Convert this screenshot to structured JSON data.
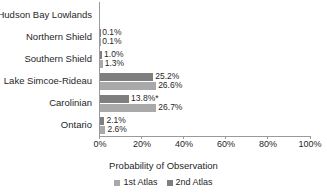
{
  "chart_data": {
    "type": "bar",
    "orientation": "horizontal",
    "title": "",
    "xlabel": "Probability of Observation",
    "ylabel": "",
    "xlim": [
      0,
      100
    ],
    "xunit": "%",
    "grid": false,
    "legend_position": "bottom",
    "xticks": [
      "0%",
      "20%",
      "40%",
      "60%",
      "80%",
      "100%"
    ],
    "xtick_values": [
      0,
      20,
      40,
      60,
      80,
      100
    ],
    "categories": [
      "Hudson Bay Lowlands",
      "Northern Shield",
      "Southern Shield",
      "Lake Simcoe-Rideau",
      "Carolinian",
      "Ontario"
    ],
    "series": [
      {
        "name": "1st Atlas",
        "color": "#a9a9a9",
        "values": [
          null,
          0.1,
          1.0,
          26.6,
          26.7,
          2.6
        ],
        "labels": [
          "",
          "0.1%",
          "1.3%",
          "26.6%",
          "26.7%",
          "2.6%"
        ]
      },
      {
        "name": "2nd Atlas",
        "color": "#7f7f7f",
        "values": [
          null,
          0.1,
          1.0,
          25.2,
          13.8,
          2.1
        ],
        "labels": [
          "",
          "0.1%",
          "1.0%",
          "25.2%",
          "13.8%*",
          "2.1%"
        ]
      }
    ],
    "annotations": [
      {
        "category": "Carolinian",
        "series": "2nd Atlas",
        "marker": "*",
        "text": "13.8%*"
      }
    ],
    "rows": [
      {
        "category": "Hudson Bay Lowlands",
        "second_atlas_value": null,
        "second_atlas_label": "",
        "first_atlas_value": null,
        "first_atlas_label": ""
      },
      {
        "category": "Northern Shield",
        "second_atlas_value": 0.1,
        "second_atlas_label": "0.1%",
        "first_atlas_value": 0.1,
        "first_atlas_label": "0.1%"
      },
      {
        "category": "Southern Shield",
        "second_atlas_value": 1.0,
        "second_atlas_label": "1.0%",
        "first_atlas_value": 1.3,
        "first_atlas_label": "1.3%"
      },
      {
        "category": "Lake Simcoe-Rideau",
        "second_atlas_value": 25.2,
        "second_atlas_label": "25.2%",
        "first_atlas_value": 26.6,
        "first_atlas_label": "26.6%"
      },
      {
        "category": "Carolinian",
        "second_atlas_value": 13.8,
        "second_atlas_label": "13.8%*",
        "first_atlas_value": 26.7,
        "first_atlas_label": "26.7%"
      },
      {
        "category": "Ontario",
        "second_atlas_value": 2.1,
        "second_atlas_label": "2.1%",
        "first_atlas_value": 2.6,
        "first_atlas_label": "2.6%"
      }
    ]
  },
  "legend": {
    "items": [
      {
        "label": "1st Atlas",
        "color": "#a9a9a9"
      },
      {
        "label": "2nd Atlas",
        "color": "#7f7f7f"
      }
    ]
  }
}
